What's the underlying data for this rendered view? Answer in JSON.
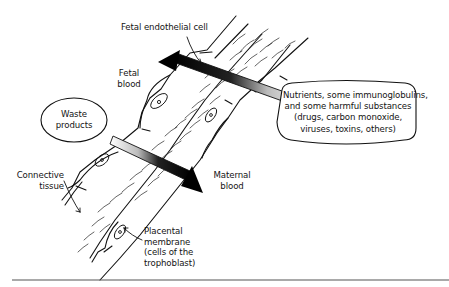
{
  "figure": {
    "type": "placental exchange diagram",
    "labels": {
      "fetal_endothelial_cell": "Fetal endothelial cell",
      "fetal_blood": [
        "Fetal",
        "blood"
      ],
      "waste_products": [
        "Waste",
        "products"
      ],
      "nutrients": [
        "Nutrients, some immunoglobulins,",
        "and some harmful substances",
        "(drugs, carbon monoxide,",
        "viruses, toxins, others)"
      ],
      "connective_tissue": [
        "Connective",
        "tissue"
      ],
      "maternal_blood": [
        "Maternal",
        "blood"
      ],
      "placental_membrane": [
        "Placental",
        "membrane",
        "(cells of the",
        "trophoblast)"
      ]
    },
    "arrows": [
      {
        "name": "waste-to-maternal",
        "direction": "down-right",
        "from": "Waste products",
        "to": "Maternal blood"
      },
      {
        "name": "nutrients-to-fetal",
        "direction": "up-left",
        "from": "Nutrients bubble",
        "to": "Fetal blood"
      }
    ],
    "colors": {
      "ink": "#111111",
      "background": "#ffffff",
      "rule": "#555555"
    }
  }
}
